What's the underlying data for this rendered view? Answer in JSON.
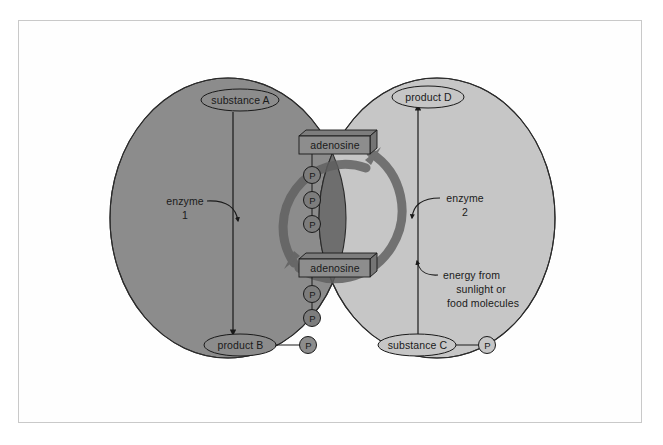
{
  "figure": {
    "type": "biochemistry-diagram",
    "colors": {
      "background": "#ffffff",
      "frame_border": "#c9c9c9",
      "left_circle_fill": "#8c8c8c",
      "right_circle_fill": "#c6c6c6",
      "overlap_fill": "#6e6e6e",
      "outline": "#2b2b2b",
      "cycle_band": "#6a6a6a",
      "text": "#1a1a1a",
      "node_fill": "#9a9a9a"
    }
  },
  "nodes": {
    "substance_a": "substance A",
    "product_b": "product B",
    "substance_c": "substance C",
    "product_d": "product D",
    "adenosine_top": "adenosine",
    "adenosine_bottom": "adenosine",
    "phosphate_symbol": "P"
  },
  "annotations": {
    "enzyme_1_name": "enzyme",
    "enzyme_1_number": "1",
    "enzyme_2_name": "enzyme",
    "enzyme_2_number": "2",
    "energy_line_1": "energy from",
    "energy_line_2": "sunlight or",
    "energy_line_3": "food molecules"
  },
  "structure": {
    "atp_phosphate_count": 3,
    "adp_phosphate_count": 2,
    "product_b_phosphate_count": 1,
    "substance_c_phosphate_count": 1,
    "left_reaction": "substance A converted to product B by enzyme 1",
    "right_reaction": "substance C converted to product D by enzyme 2"
  }
}
